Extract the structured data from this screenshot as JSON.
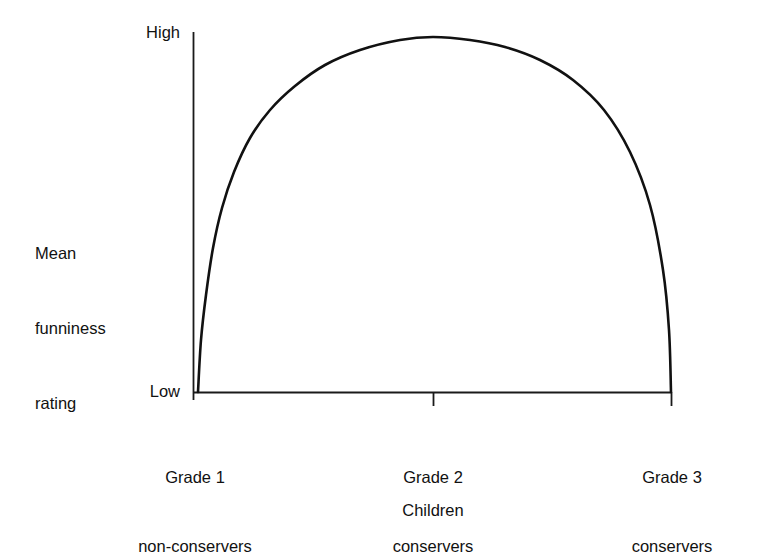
{
  "chart_data": {
    "type": "line",
    "title": "",
    "subtitle": "",
    "xlabel": "Children",
    "ylabel": "Mean\nfunniness\nrating",
    "ylabel_lines": [
      "Mean",
      "funniness",
      "rating"
    ],
    "grid": false,
    "legend": "none",
    "ytick_labels": [
      "High",
      "Low"
    ],
    "ylim_labels": {
      "min": "Low",
      "max": "High"
    },
    "categories": [
      "Grade 1\nnon-conservers",
      "Grade 2\nconservers",
      "Grade 3\nconservers"
    ],
    "xtick_labels": [
      {
        "line1": "Grade 1",
        "line2": "non-conservers"
      },
      {
        "line1": "Grade 2",
        "line2": "conservers"
      },
      {
        "line1": "Grade 3",
        "line2": "conservers"
      }
    ],
    "values": [
      0.0,
      1.0,
      0.0
    ],
    "annotation": "Inverted-U curve: funniness rating is lowest for Grade 1 non-conservers, peaks for Grade 2 conservers, and falls back to lowest for Grade 3 conservers.",
    "curve_points": [
      [
        198,
        392
      ],
      [
        201,
        340
      ],
      [
        206,
        295
      ],
      [
        213,
        248
      ],
      [
        222,
        208
      ],
      [
        234,
        172
      ],
      [
        250,
        138
      ],
      [
        270,
        110
      ],
      [
        295,
        86
      ],
      [
        325,
        65
      ],
      [
        360,
        50
      ],
      [
        400,
        40
      ],
      [
        433,
        37
      ],
      [
        470,
        40
      ],
      [
        505,
        47
      ],
      [
        540,
        60
      ],
      [
        573,
        80
      ],
      [
        604,
        110
      ],
      [
        630,
        152
      ],
      [
        650,
        205
      ],
      [
        663,
        270
      ],
      [
        669,
        330
      ],
      [
        671,
        392
      ]
    ],
    "axes": {
      "y_axis_x": 193,
      "y_axis_top": 32,
      "y_axis_bottom": 400,
      "x_axis_y": 392,
      "x_axis_left": 193,
      "x_axis_right": 672,
      "tick_positions_x": [
        193,
        433,
        672
      ],
      "line_color": "#1a1a1a",
      "curve_color": "#111111"
    }
  },
  "colors": {
    "background": "#ffffff",
    "ink": "#111111",
    "axis": "#1a1a1a"
  },
  "labels": {
    "y_high": "High",
    "y_low": "Low",
    "y_title_line1": "Mean",
    "y_title_line2": "funniness",
    "y_title_line3": "rating",
    "x_title": "Children",
    "grade1_line1": "Grade 1",
    "grade1_line2": "non-conservers",
    "grade2_line1": "Grade 2",
    "grade2_line2": "conservers",
    "grade3_line1": "Grade 3",
    "grade3_line2": "conservers"
  }
}
